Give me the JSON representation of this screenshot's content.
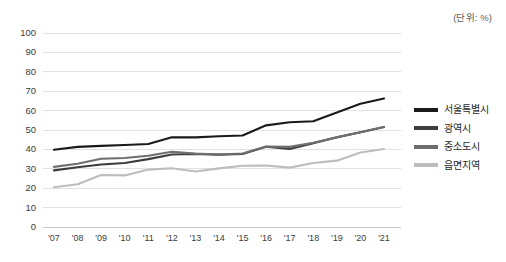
{
  "unit_note": "(단위: %)",
  "legend": {
    "items": [
      {
        "label": "서울특별시",
        "color": "#1a1a1a"
      },
      {
        "label": "광역시",
        "color": "#3d3d3d"
      },
      {
        "label": "중소도시",
        "color": "#6e6e6e"
      },
      {
        "label": "읍면지역",
        "color": "#bdbdbd"
      }
    ]
  },
  "axis": {
    "y_ticks": [
      "0",
      "10",
      "20",
      "30",
      "40",
      "50",
      "60",
      "70",
      "80",
      "90",
      "100"
    ],
    "x_ticks": [
      "'07",
      "'08",
      "'09",
      "'10",
      "'11",
      "'12",
      "'13",
      "'14",
      "'15",
      "'16",
      "'17",
      "'18",
      "'19",
      "'20",
      "'21"
    ]
  },
  "chart_data": {
    "type": "line",
    "title": "",
    "subtitle": "",
    "xlabel": "",
    "ylabel": "",
    "unit": "(단위: %)",
    "ylim": [
      0,
      100
    ],
    "y_tick_step": 10,
    "grid": true,
    "legend_position": "right",
    "x": [
      "'07",
      "'08",
      "'09",
      "'10",
      "'11",
      "'12",
      "'13",
      "'14",
      "'15",
      "'16",
      "'17",
      "'18",
      "'19",
      "'20",
      "'21"
    ],
    "categories": [
      "'07",
      "'08",
      "'09",
      "'10",
      "'11",
      "'12",
      "'13",
      "'14",
      "'15",
      "'16",
      "'17",
      "'18",
      "'19",
      "'20",
      "'21"
    ],
    "series": [
      {
        "name": "서울특별시",
        "color": "#1a1a1a",
        "values": [
          39.8,
          41.3,
          41.8,
          42.3,
          42.8,
          46.3,
          46.2,
          46.8,
          47.2,
          52.4,
          54.0,
          54.5,
          59.0,
          63.5,
          66.2
        ]
      },
      {
        "name": "광역시",
        "color": "#3d3d3d",
        "values": [
          29.2,
          30.8,
          32.2,
          33.0,
          35.0,
          37.4,
          37.6,
          37.3,
          37.6,
          41.4,
          40.2,
          43.2,
          46.3,
          48.8,
          51.5
        ]
      },
      {
        "name": "중소도시",
        "color": "#6e6e6e",
        "values": [
          31.0,
          32.6,
          35.2,
          35.6,
          36.7,
          38.8,
          37.8,
          37.4,
          37.9,
          41.5,
          41.3,
          43.4,
          46.2,
          48.8,
          51.5
        ]
      },
      {
        "name": "읍면지역",
        "color": "#bdbdbd",
        "values": [
          20.5,
          22.0,
          26.8,
          26.6,
          29.6,
          30.3,
          28.6,
          30.2,
          31.6,
          31.7,
          30.6,
          33.0,
          34.2,
          38.4,
          40.2
        ]
      }
    ]
  }
}
